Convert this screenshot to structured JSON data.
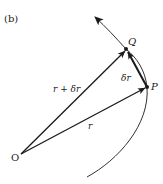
{
  "figure": {
    "panel_label": "(b)",
    "points": {
      "origin": "O",
      "p": "P",
      "q": "Q"
    },
    "vectors": {
      "r": "r",
      "r_plus_dr": "r + δr",
      "dr": "δr"
    },
    "colors": {
      "ink": "#1a1a1a",
      "background": "#ffffff"
    }
  }
}
